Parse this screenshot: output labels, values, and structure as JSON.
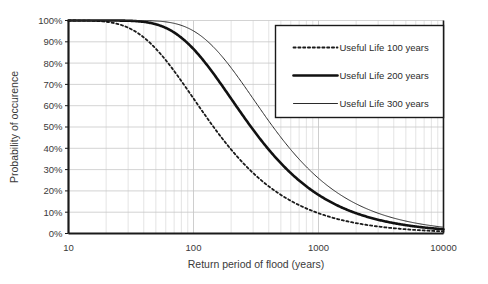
{
  "chart_data": {
    "type": "line",
    "title": "",
    "xlabel": "Return period of flood (years)",
    "ylabel": "Probability of occurence",
    "xscale": "log",
    "xlim": [
      10,
      10000
    ],
    "ylim": [
      0,
      100
    ],
    "grid": true,
    "legend_position": "top-right",
    "xticks": [
      "10",
      "100",
      "1000",
      "10000"
    ],
    "xtick_values": [
      10,
      100,
      1000,
      10000
    ],
    "yticks": [
      "0%",
      "10%",
      "20%",
      "30%",
      "40%",
      "50%",
      "60%",
      "70%",
      "80%",
      "90%",
      "100%"
    ],
    "ytick_values": [
      0,
      10,
      20,
      30,
      40,
      50,
      60,
      70,
      80,
      90,
      100
    ],
    "formula": "P = 1 - (1 - 1/T)^L",
    "x": [
      10,
      15,
      20,
      25,
      30,
      40,
      50,
      60,
      80,
      100,
      130,
      160,
      200,
      250,
      300,
      400,
      500,
      650,
      800,
      1000,
      1300,
      1600,
      2000,
      2500,
      3000,
      4000,
      5000,
      6500,
      8000,
      10000
    ],
    "series": [
      {
        "name": "Useful Life 100 years",
        "life": 100,
        "style": "dotted",
        "width": 1.8,
        "color": "#1a1a1a",
        "values": [
          100.0,
          99.9,
          99.4,
          98.3,
          96.7,
          92.4,
          86.7,
          81.0,
          71.4,
          63.4,
          53.8,
          46.4,
          39.4,
          33.0,
          28.4,
          22.2,
          18.1,
          14.2,
          11.8,
          9.5,
          7.4,
          6.1,
          4.9,
          3.9,
          3.3,
          2.5,
          2.0,
          1.5,
          1.2,
          1.0
        ]
      },
      {
        "name": "Useful Life 200 years",
        "life": 200,
        "style": "solid",
        "width": 2.6,
        "color": "#111111",
        "values": [
          100.0,
          100.0,
          100.0,
          100.0,
          99.9,
          99.4,
          98.2,
          96.4,
          92.2,
          86.6,
          78.6,
          71.3,
          63.3,
          55.1,
          48.8,
          39.4,
          33.0,
          26.5,
          22.1,
          18.1,
          14.3,
          11.8,
          9.5,
          7.7,
          6.5,
          4.9,
          3.9,
          3.0,
          2.5,
          2.0
        ]
      },
      {
        "name": "Useful Life 300 years",
        "life": 300,
        "style": "solid",
        "width": 1.0,
        "color": "#2b2b2b",
        "values": [
          100.0,
          100.0,
          100.0,
          100.0,
          100.0,
          100.0,
          99.8,
          99.3,
          97.8,
          95.1,
          90.1,
          84.6,
          77.7,
          70.0,
          63.3,
          52.8,
          45.2,
          36.9,
          31.2,
          25.9,
          20.6,
          17.1,
          13.9,
          11.3,
          9.5,
          7.2,
          5.8,
          4.5,
          3.7,
          3.0
        ]
      }
    ],
    "legend": [
      {
        "label": "Useful Life 100 years",
        "style": "dotted",
        "width": 1.8,
        "color": "#1a1a1a"
      },
      {
        "label": "Useful Life 200 years",
        "style": "solid",
        "width": 2.6,
        "color": "#111111"
      },
      {
        "label": "Useful Life 300 years",
        "style": "solid",
        "width": 1.0,
        "color": "#2b2b2b"
      }
    ]
  },
  "axes": {
    "y_title": "Probability of occurence",
    "x_title": "Return period of flood (years)",
    "y_labels": [
      "100%",
      "90%",
      "80%",
      "70%",
      "60%",
      "50%",
      "40%",
      "30%",
      "20%",
      "10%",
      "0%"
    ],
    "x_labels": [
      "10",
      "100",
      "1000",
      "10000"
    ]
  },
  "legend": {
    "items": [
      {
        "label": "Useful Life 100 years"
      },
      {
        "label": "Useful Life 200 years"
      },
      {
        "label": "Useful Life 300 years"
      }
    ]
  },
  "colors": {
    "axis": "#1a1a1a",
    "grid": "#c8c8c8",
    "minor_grid": "#d8d8d8",
    "text": "#3a3a3a",
    "background": "#ffffff"
  }
}
